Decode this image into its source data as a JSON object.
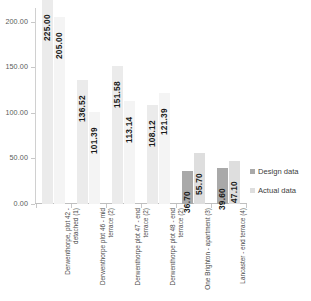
{
  "chart_data": {
    "type": "bar",
    "title": "",
    "subtitle": "",
    "xlabel": "",
    "ylabel": "",
    "ylim": [
      0,
      215
    ],
    "grid": false,
    "legend_position": "right",
    "orientation": "vertical",
    "grouping": "clustered",
    "y_ticks": [
      "0.00",
      "50.00",
      "100.00",
      "150.00",
      "200.00"
    ],
    "y_tick_values": [
      0,
      50,
      100,
      150,
      200
    ],
    "categories": [
      "Derwenthorpe, plot 42 - detached (1)",
      "Derwenthorpe  plot 46 - mid terrace (2)",
      "Derwenthorpe plot 47 - end terrace (2)",
      "Derwenthorpe plot 48 - end terrace (2)",
      "One Brighton - apartment (3)",
      "Lancaster - end terrace (4)"
    ],
    "series": [
      {
        "name": "Design data",
        "color": "#a9a9a9",
        "values": [
          225.0,
          136.52,
          151.58,
          108.12,
          36.7,
          39.6
        ],
        "labels": [
          "225.00",
          "136.52",
          "151.58",
          "108.12",
          "36.70",
          "39.60"
        ]
      },
      {
        "name": "Actual data",
        "color": "#dedede",
        "values": [
          205.0,
          101.39,
          113.14,
          121.39,
          55.7,
          47.1
        ],
        "labels": [
          "205.00",
          "101.39",
          "113.14",
          "121.39",
          "55.70",
          "47.10"
        ]
      }
    ]
  },
  "legend": {
    "items": [
      {
        "label": "Design data",
        "color": "#a9a9a9"
      },
      {
        "label": "Actual data",
        "color": "#dedede"
      }
    ]
  }
}
